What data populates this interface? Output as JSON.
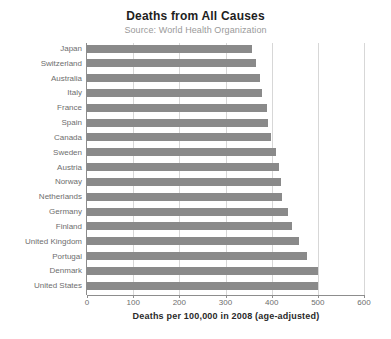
{
  "chart_data": {
    "type": "bar",
    "orientation": "horizontal",
    "title": "Deaths from All Causes",
    "subtitle": "Source: World Health Organization",
    "xlabel": "Deaths per 100,000 in 2008 (age-adjusted)",
    "ylabel": "",
    "xlim": [
      0,
      600
    ],
    "xticks": [
      0,
      100,
      200,
      300,
      400,
      500,
      600
    ],
    "grid": true,
    "legend": false,
    "bar_color": "#8a8a8a",
    "categories": [
      "Japan",
      "Switzerland",
      "Australia",
      "Italy",
      "France",
      "Spain",
      "Canada",
      "Sweden",
      "Austria",
      "Norway",
      "Netherlands",
      "Germany",
      "Finland",
      "United Kingdom",
      "Portugal",
      "Denmark",
      "United States"
    ],
    "values": [
      357,
      367,
      374,
      378,
      389,
      391,
      398,
      409,
      415,
      420,
      422,
      435,
      443,
      459,
      476,
      500,
      500
    ]
  }
}
